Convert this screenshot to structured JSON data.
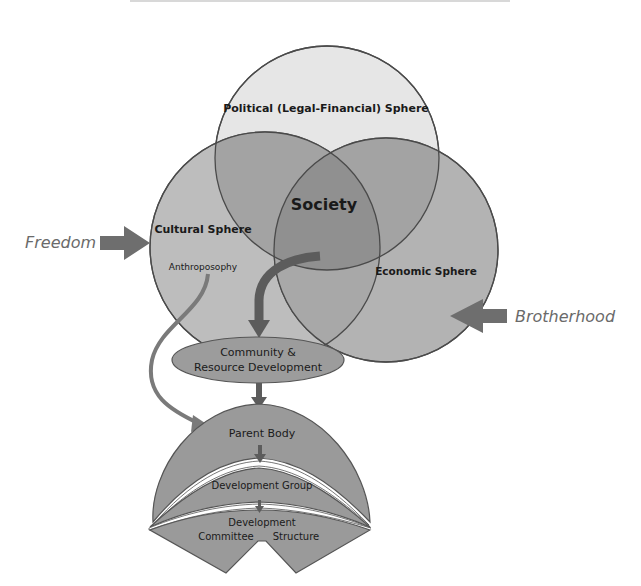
{
  "diagram": {
    "spheres": {
      "political": {
        "label": "Political (Legal-Financial) Sphere"
      },
      "cultural": {
        "label": "Cultural Sphere",
        "sub_label": "Anthroposophy"
      },
      "economic": {
        "label": "Economic Sphere"
      },
      "center": {
        "label": "Society"
      }
    },
    "inputs": {
      "left": {
        "label": "Freedom"
      },
      "right": {
        "label": "Brotherhood"
      }
    },
    "flow": {
      "community": {
        "label_line1": "Community &",
        "label_line2": "Resource Development"
      },
      "parent_body": {
        "label": "Parent Body"
      },
      "development_group": {
        "label": "Development Group"
      },
      "committee": {
        "label_line1": "Development",
        "label_line2_left": "Committee",
        "label_line2_right": "Structure"
      }
    },
    "colors": {
      "political_fill": "#e6e6e6",
      "cultural_fill": "#bdbdbd",
      "economic_fill": "#b0b0b0",
      "overlap_fill": "#9e9e9e",
      "society_fill": "#8f8f8f",
      "arrow_dark": "#5c5c5c",
      "arrow_mid": "#7a7a7a",
      "flow_fill": "#9a9a9a",
      "outline": "#555555",
      "input_text": "#6a6a6a"
    }
  }
}
